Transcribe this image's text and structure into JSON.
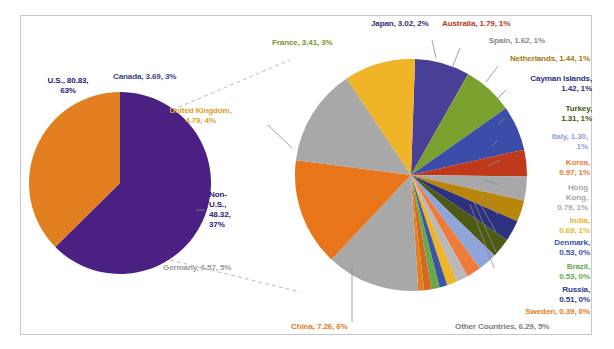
{
  "chart_data": {
    "type": "pie",
    "title": "",
    "subtitle": "",
    "xlabel": "",
    "ylabel": "",
    "legend_position": "labels-outside",
    "grid": false,
    "charts": [
      {
        "name": "overview-pie",
        "categories": [
          "U.S.",
          "Non-U.S."
        ],
        "values": [
          80.83,
          48.32
        ],
        "percents": [
          "63%",
          "37%"
        ],
        "colors": [
          "#4a2082",
          "#e28021"
        ]
      },
      {
        "name": "breakdown-pie",
        "categories": [
          "Canada",
          "France",
          "Japan",
          "Australia",
          "Spain",
          "Netherlands",
          "Cayman Islands",
          "Turkey",
          "Italy",
          "Korea",
          "Hong Kong",
          "India",
          "Denmark",
          "Brazil",
          "Russia",
          "Sweden",
          "Other Countries",
          "China",
          "Germany",
          "United Kingdom"
        ],
        "values": [
          3.69,
          3.41,
          3.02,
          1.79,
          1.62,
          1.44,
          1.42,
          1.31,
          1.3,
          0.97,
          0.79,
          0.69,
          0.53,
          0.53,
          0.51,
          0.39,
          6.29,
          7.26,
          6.57,
          4.79
        ],
        "percents": [
          "3%",
          "3%",
          "2%",
          "1%",
          "1%",
          "1%",
          "1%",
          "1%",
          "1%",
          "1%",
          "1%",
          "1%",
          "0%",
          "0%",
          "0%",
          "0%",
          "5%",
          "6%",
          "5%",
          "4%"
        ],
        "colors": [
          "#4a3f96",
          "#7aa02e",
          "#3b4da8",
          "#c0391b",
          "#a8a8a8",
          "#b8860b",
          "#2e3180",
          "#4d5a15",
          "#8fa4d8",
          "#ef7a3a",
          "#b9b9b9",
          "#f0b429",
          "#3b55a4",
          "#6aa84f",
          "#d2691e",
          "#e28021",
          "#a8a8a8",
          "#e8751a",
          "#a8a8a8",
          "#f0b429"
        ]
      }
    ]
  },
  "labels": {
    "us": "U.S., 80.83,\n63%",
    "non_us": "Non-\nU.S.,\n48.32,\n37%",
    "canada": "Canada, 3.69, 3%",
    "united_kingdom": "United Kingdom,\n4.79, 4%",
    "germany": "Germany, 6.57, 5%",
    "france": "France, 3.41, 3%",
    "japan": "Japan, 3.02, 2%",
    "australia": "Australia, 1.79, 1%",
    "spain": "Spain, 1.62, 1%",
    "netherlands": "Netherlands, 1.44, 1%",
    "cayman": "Cayman Islands,\n1.42, 1%",
    "turkey": "Turkey,\n1.31, 1%",
    "italy": "Italy, 1.30,\n1%",
    "korea": "Korea,\n0.97, 1%",
    "hongkong": "Hong\nKong,\n0.79, 1%",
    "india": "India,\n0.69, 1%",
    "denmark": "Denmark,\n0.53, 0%",
    "brazil": "Brazil,\n0.53, 0%",
    "russia": "Russia,\n0.51, 0%",
    "sweden": "Sweden, 0.39, 0%",
    "other": "Other Countries, 6.29, 5%",
    "china": "China, 7.26, 6%"
  },
  "label_colors": {
    "us": "#33207a",
    "non_us": "#33207a",
    "canada": "#3a3f8f",
    "united_kingdom": "#e0a01e",
    "germany": "#9a9a9a",
    "france": "#7a9a2e",
    "japan": "#33307e",
    "australia": "#b8391b",
    "spain": "#8a8a8a",
    "netherlands": "#a8780b",
    "cayman": "#2e3180",
    "turkey": "#4d5a15",
    "italy": "#8fa4d8",
    "korea": "#ef7a3a",
    "hongkong": "#a8a8a8",
    "india": "#f0b429",
    "denmark": "#3b55a4",
    "brazil": "#6aa84f",
    "russia": "#2b3f8f",
    "sweden": "#e28021",
    "other": "#7d7d7d",
    "china": "#e8751a"
  }
}
